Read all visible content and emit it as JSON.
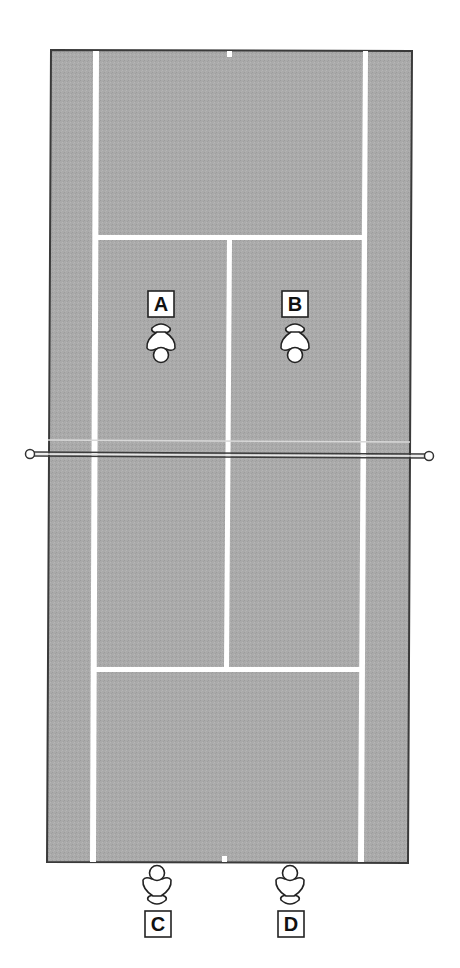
{
  "diagram": {
    "type": "tennis-court-doubles-positions",
    "colors": {
      "court": "#a9a9a9",
      "lines": "#ffffff",
      "border": "#3a3a3a",
      "player_fill": "#ffffff",
      "player_stroke": "#222222",
      "net": "#444444"
    },
    "players": [
      {
        "id": "A",
        "label": "A",
        "side": "far",
        "facing": "net",
        "position": "left-service-box"
      },
      {
        "id": "B",
        "label": "B",
        "side": "far",
        "facing": "net",
        "position": "right-service-box"
      },
      {
        "id": "C",
        "label": "C",
        "side": "near",
        "facing": "net",
        "position": "behind-baseline-left"
      },
      {
        "id": "D",
        "label": "D",
        "side": "near",
        "facing": "net",
        "position": "behind-baseline-right"
      }
    ]
  }
}
